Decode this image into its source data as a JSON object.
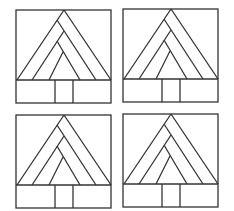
{
  "diagram": {
    "colors": {
      "line": "#333333",
      "background": "#ffffff"
    },
    "tiles": [
      {
        "id": "tile-1",
        "position": "top-left",
        "x": 15,
        "y": 9
      },
      {
        "id": "tile-2",
        "position": "top-right",
        "x": 122,
        "y": 8
      },
      {
        "id": "tile-3",
        "position": "bottom-left",
        "x": 15,
        "y": 114
      },
      {
        "id": "tile-4",
        "position": "bottom-right",
        "x": 122,
        "y": 113
      }
    ]
  }
}
